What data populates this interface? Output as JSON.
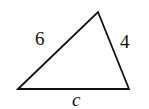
{
  "diagram": {
    "type": "triangle",
    "sides": [
      {
        "id": "left",
        "label": "6"
      },
      {
        "id": "right",
        "label": "4"
      },
      {
        "id": "bottom",
        "label": "c"
      }
    ],
    "colors": {
      "stroke": "#111111",
      "background": "#ffffff"
    }
  }
}
